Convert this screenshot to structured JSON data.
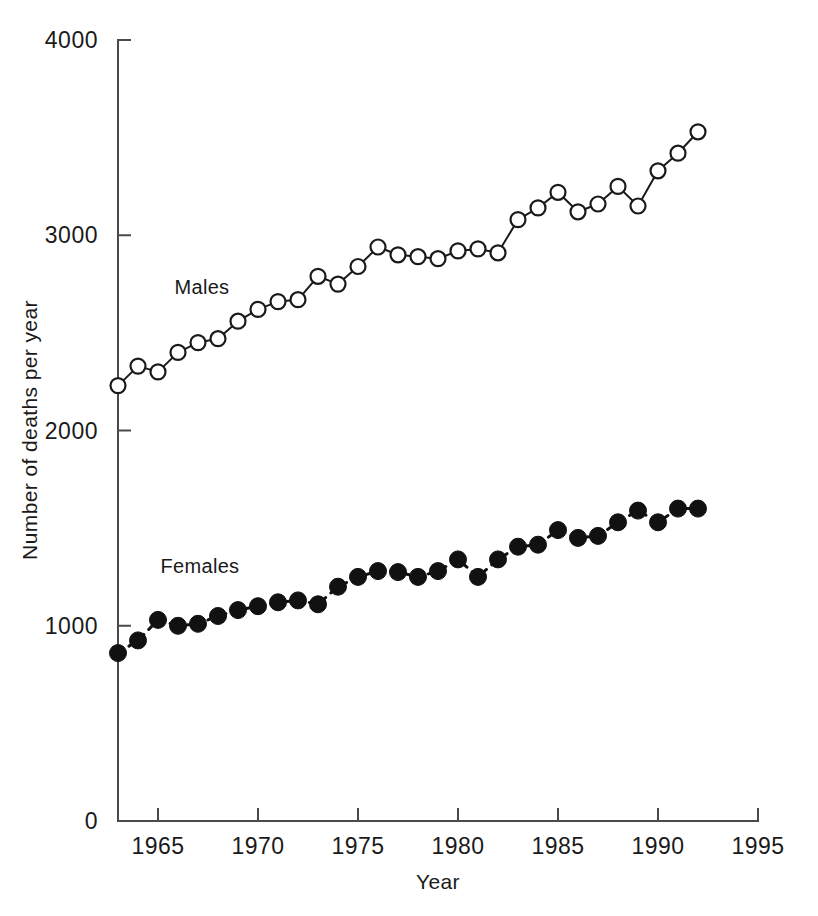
{
  "chart_data": {
    "type": "line",
    "title": "",
    "xlabel": "Year",
    "ylabel": "Number of deaths per year",
    "xlim": [
      1963,
      1995
    ],
    "ylim": [
      0,
      4000
    ],
    "xticks": [
      1965,
      1970,
      1975,
      1980,
      1985,
      1990,
      1995
    ],
    "yticks": [
      0,
      1000,
      2000,
      3000,
      4000
    ],
    "xtick_labels": [
      "1965",
      "1970",
      "1975",
      "1980",
      "1985",
      "1990",
      "1995"
    ],
    "ytick_labels": [
      "0",
      "1000",
      "2000",
      "3000",
      "4000"
    ],
    "grid": false,
    "legend": "inline-annotations",
    "x": [
      1963,
      1964,
      1965,
      1966,
      1967,
      1968,
      1969,
      1970,
      1971,
      1972,
      1973,
      1974,
      1975,
      1976,
      1977,
      1978,
      1979,
      1980,
      1981,
      1982,
      1983,
      1984,
      1985,
      1986,
      1987,
      1988,
      1989,
      1990,
      1991,
      1992
    ],
    "series": [
      {
        "name": "Males",
        "marker": "open-circle",
        "linestyle": "solid",
        "color": "#1a1a1a",
        "label_x": 1967.2,
        "label_y": 2700,
        "values": [
          2230,
          2330,
          2300,
          2400,
          2450,
          2470,
          2560,
          2620,
          2660,
          2670,
          2790,
          2750,
          2840,
          2940,
          2900,
          2890,
          2880,
          2920,
          2930,
          2910,
          3080,
          3140,
          3220,
          3120,
          3160,
          3250,
          3150,
          3330,
          3420,
          3530
        ]
      },
      {
        "name": "Females",
        "marker": "filled-circle",
        "linestyle": "dashed",
        "color": "#111111",
        "label_x": 1967.1,
        "label_y": 1270,
        "values": [
          860,
          925,
          1030,
          1000,
          1010,
          1050,
          1080,
          1100,
          1120,
          1130,
          1110,
          1200,
          1250,
          1280,
          1275,
          1250,
          1280,
          1340,
          1250,
          1340,
          1405,
          1415,
          1490,
          1450,
          1460,
          1530,
          1590,
          1530,
          1600,
          1600
        ]
      }
    ]
  },
  "axes": {
    "x_axis_name": "year-axis",
    "y_axis_name": "deaths-axis"
  }
}
